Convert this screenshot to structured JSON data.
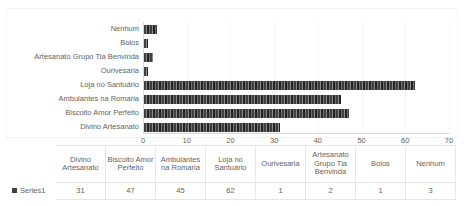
{
  "chart_data": {
    "type": "bar",
    "orientation": "horizontal",
    "title": "",
    "xlabel": "",
    "ylabel": "",
    "categories": [
      "Divino Artesanato",
      "Biscoito Amor Perfeito",
      "Ambulantes na Romaria",
      "Loja no Santuário",
      "Ourivesaria",
      "Artesanato Grupo Tia Benvinda",
      "Bolos",
      "Nenhum"
    ],
    "series": [
      {
        "name": "Series1",
        "values": [
          31,
          47,
          45,
          62,
          1,
          2,
          1,
          3
        ]
      }
    ],
    "xlim": [
      0,
      70
    ],
    "xticks": [
      0,
      10,
      20,
      30,
      40,
      50,
      60,
      70
    ],
    "xtick_labels": [
      "0",
      "10",
      "20",
      "30",
      "40",
      "50",
      "60",
      "70"
    ],
    "grid": true,
    "legend_position": "table",
    "bar_color": "#404040"
  },
  "axis": {
    "category_labels_top_to_bottom": [
      "Nenhum",
      "Bolos",
      "Artesanato Grupo Tia Benvinda",
      "Ourivesaria",
      "Loja no Santuário",
      "Ambulantes na Romaria",
      "Biscoito Amor Perfeito",
      "Divino Artesanato"
    ]
  },
  "table": {
    "legend_label": "Series1",
    "headers": [
      "Divino Artesanato",
      "Biscoito Amor Perfeito",
      "Ambulantes na Romaria",
      "Loja no Santuário",
      "Ourivesaria",
      "Artesanato Grupo Tia Benvinda",
      "Bolos",
      "Nenhum"
    ],
    "values": [
      "31",
      "47",
      "45",
      "62",
      "1",
      "2",
      "1",
      "3"
    ]
  }
}
